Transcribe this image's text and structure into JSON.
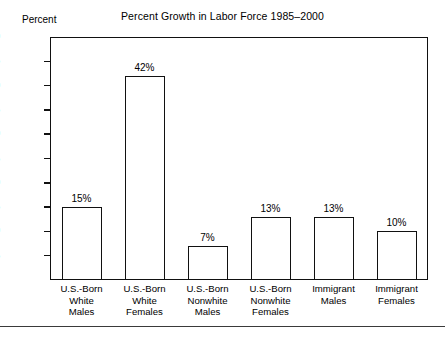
{
  "chart_data": {
    "type": "bar",
    "title": "Percent Growth in Labor Force 1985–2000",
    "xlabel": "",
    "ylabel": "Percent",
    "ylim": [
      0,
      50
    ],
    "ytick_step": 5,
    "yticks": [
      50,
      45,
      40,
      35,
      30,
      25,
      20,
      15,
      10,
      5
    ],
    "grid": false,
    "legend": false,
    "bar_facecolor": "#ffffff",
    "bar_edgecolor": "#111111",
    "categories": [
      "U.S.-Born White Males",
      "U.S.-Born White Females",
      "U.S.-Born Nonwhite Males",
      "U.S.-Born Nonwhite Females",
      "Immigrant Males",
      "Immigrant Females"
    ],
    "category_lines": [
      [
        "U.S.-Born",
        "White",
        "Males"
      ],
      [
        "U.S.-Born",
        "White",
        "Females"
      ],
      [
        "U.S.-Born",
        "Nonwhite",
        "Males"
      ],
      [
        "U.S.-Born",
        "Nonwhite",
        "Females"
      ],
      [
        "Immigrant",
        "Males"
      ],
      [
        "Immigrant",
        "Females"
      ]
    ],
    "values": [
      15,
      42,
      7,
      13,
      13,
      10
    ],
    "value_labels": [
      "15%",
      "42%",
      "7%",
      "13%",
      "13%",
      "10%"
    ]
  },
  "axis": {
    "y_title": "Percent",
    "ticks": [
      {
        "label": "50",
        "value": 50
      },
      {
        "label": "45",
        "value": 45
      },
      {
        "label": "40",
        "value": 40
      },
      {
        "label": "35",
        "value": 35
      },
      {
        "label": "30",
        "value": 30
      },
      {
        "label": "25",
        "value": 25
      },
      {
        "label": "20",
        "value": 20
      },
      {
        "label": "15",
        "value": 15
      },
      {
        "label": "10",
        "value": 10
      },
      {
        "label": "5",
        "value": 5
      }
    ]
  }
}
